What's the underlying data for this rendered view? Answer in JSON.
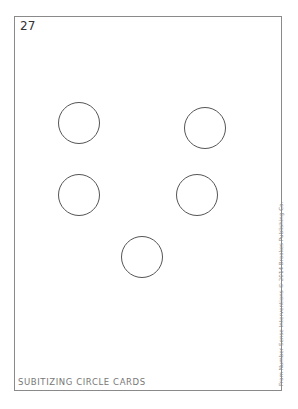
{
  "card": {
    "number": "27",
    "circles": [
      {
        "cx": 79,
        "cy": 123
      },
      {
        "cx": 205,
        "cy": 128
      },
      {
        "cx": 79,
        "cy": 195
      },
      {
        "cx": 197,
        "cy": 195
      },
      {
        "cx": 142,
        "cy": 257
      }
    ],
    "circle_count": 5,
    "footer_title": "SUBITIZING CIRCLE CARDS",
    "credit": "From Number Sense Interventions © 2014 Brookes Publishing Co."
  },
  "colors": {
    "border": "#8a8a8a",
    "circle_stroke": "#555555",
    "footer_text": "#777777"
  }
}
